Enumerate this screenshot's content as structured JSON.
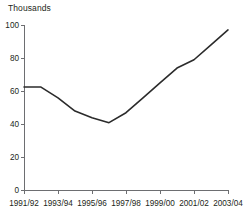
{
  "figure": {
    "axis_title": "Thousands",
    "line_color": "#2b2b2b",
    "axis_color": "#6d6e71",
    "text_color": "#231f20",
    "background": "#ffffff"
  },
  "chart_data": {
    "type": "line",
    "title": "",
    "subtitle": "",
    "xlabel": "",
    "ylabel": "Thousands",
    "ylim": [
      0,
      100
    ],
    "yticks": [
      0,
      20,
      40,
      60,
      80,
      100
    ],
    "ytick_labels": [
      "0",
      "20",
      "40",
      "60",
      "80",
      "100"
    ],
    "xticks": [
      "1991/92",
      "1993/94",
      "1995/96",
      "1997/98",
      "1999/00",
      "2001/02",
      "2003/04"
    ],
    "categories": [
      "1991/92",
      "1992/93",
      "1993/94",
      "1994/95",
      "1995/96",
      "1996/97",
      "1997/98",
      "1998/99",
      "1999/00",
      "2000/01",
      "2001/02",
      "2002/03",
      "2003/04"
    ],
    "values": [
      62.5,
      62.5,
      56,
      48,
      44,
      41,
      47,
      56,
      65,
      74,
      79,
      88,
      97
    ],
    "series": [
      {
        "name": "Thousands",
        "values": [
          62.5,
          62.5,
          56,
          48,
          44,
          41,
          47,
          56,
          65,
          74,
          79,
          88,
          97
        ]
      }
    ],
    "grid": false,
    "legend": false,
    "legend_position": "none",
    "annotations": []
  }
}
